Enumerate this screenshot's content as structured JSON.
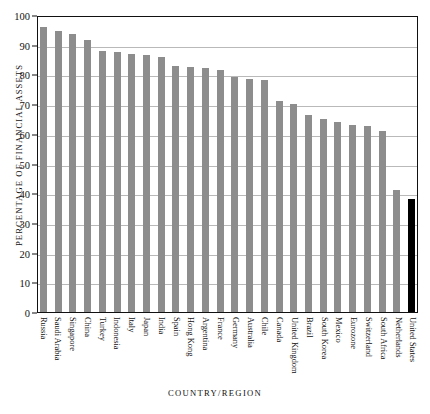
{
  "figure": {
    "top_cut_caption": "",
    "background_color": "#ffffff",
    "bar_color": "#8d8d8d",
    "highlight_color": "#000000",
    "axis_color": "#111111",
    "grid_color": "#b9b9b9"
  },
  "chart_data": {
    "type": "bar",
    "title": "",
    "xlabel": "COUNTRY/REGION",
    "ylabel": "PERCENTAGE OF FINANCIAL ASSETS",
    "ylim": [
      0,
      100
    ],
    "yticks": [
      0,
      10,
      20,
      30,
      40,
      50,
      60,
      70,
      80,
      90,
      100
    ],
    "ytick_labels": [
      "0",
      "10",
      "20",
      "30",
      "40",
      "50",
      "60",
      "70",
      "80",
      "90",
      "100"
    ],
    "grid": true,
    "legend": "none",
    "highlight_category": "United States",
    "categories": [
      "Russia",
      "Saudi Arabia",
      "Singapore",
      "China",
      "Turkey",
      "Indonesia",
      "Italy",
      "Japan",
      "India",
      "Spain",
      "Hong Kong",
      "Argentina",
      "France",
      "Germany",
      "Australia",
      "Chile",
      "Canada",
      "United Kingdom",
      "Brazil",
      "South Korea",
      "Mexico",
      "Eurozone",
      "Switzerland",
      "South Africa",
      "Netherlands",
      "United States"
    ],
    "values": [
      96,
      94.5,
      93.5,
      91.5,
      88,
      87.5,
      87,
      86.5,
      86,
      83,
      82.5,
      82,
      81.5,
      79,
      78.5,
      78,
      71,
      70,
      66.5,
      65,
      64,
      63,
      62.5,
      61,
      41,
      38
    ]
  }
}
